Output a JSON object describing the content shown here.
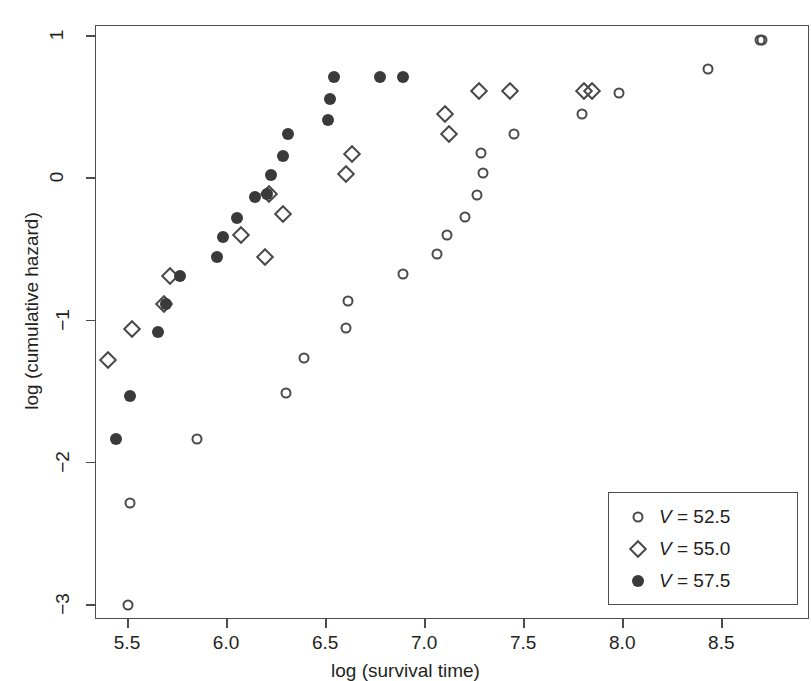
{
  "chart_data": {
    "type": "scatter",
    "title": "",
    "xlabel": "log (survival time)",
    "ylabel": "log (cumulative hazard)",
    "xlim": [
      5.34,
      8.94
    ],
    "ylim": [
      -3.17,
      1.07
    ],
    "xticks": [
      "5.5",
      "6.0",
      "6.5",
      "7.0",
      "7.5",
      "8.0",
      "8.5"
    ],
    "xtick_values": [
      5.5,
      6.0,
      6.5,
      7.0,
      7.5,
      8.0,
      8.5
    ],
    "yticks": [
      "1",
      "0",
      "−1",
      "−2",
      "−3"
    ],
    "ytick_values": [
      1,
      0,
      -1,
      -2,
      -3
    ],
    "grid": false,
    "legend_position": "bottom-right",
    "series": [
      {
        "name": "V = 52.5",
        "label_prefix": "V",
        "label_value": "52.5",
        "marker": "open-circle",
        "color": "#4a4a4a",
        "points": [
          [
            5.5,
            -3.0
          ],
          [
            5.51,
            -2.28
          ],
          [
            5.85,
            -1.83
          ],
          [
            6.3,
            -1.51
          ],
          [
            6.39,
            -1.26
          ],
          [
            6.6,
            -1.05
          ],
          [
            6.61,
            -0.86
          ],
          [
            6.89,
            -0.67
          ],
          [
            7.06,
            -0.53
          ],
          [
            7.11,
            -0.4
          ],
          [
            7.2,
            -0.27
          ],
          [
            7.26,
            -0.12
          ],
          [
            7.29,
            0.04
          ],
          [
            7.45,
            0.31
          ],
          [
            7.28,
            0.18
          ],
          [
            7.79,
            0.45
          ],
          [
            7.98,
            0.6
          ],
          [
            8.43,
            0.77
          ],
          [
            8.69,
            0.97
          ],
          [
            8.7,
            0.97
          ]
        ]
      },
      {
        "name": "V = 55.0",
        "label_prefix": "V",
        "label_value": "55.0",
        "marker": "open-diamond",
        "color": "#4a4a4a",
        "points": [
          [
            5.4,
            -1.28
          ],
          [
            5.52,
            -1.06
          ],
          [
            5.68,
            -0.88
          ],
          [
            5.71,
            -0.69
          ],
          [
            6.07,
            -0.4
          ],
          [
            6.19,
            -0.55
          ],
          [
            6.21,
            -0.11
          ],
          [
            6.28,
            -0.25
          ],
          [
            6.6,
            0.03
          ],
          [
            6.63,
            0.17
          ],
          [
            7.1,
            0.45
          ],
          [
            7.12,
            0.31
          ],
          [
            7.27,
            0.61
          ],
          [
            7.43,
            0.61
          ],
          [
            7.8,
            0.61
          ],
          [
            7.84,
            0.61
          ]
        ]
      },
      {
        "name": "V = 57.5",
        "label_prefix": "V",
        "label_value": "57.5",
        "marker": "filled-circle",
        "color": "#3a3a3a",
        "points": [
          [
            5.44,
            -1.83
          ],
          [
            5.51,
            -1.53
          ],
          [
            5.65,
            -1.08
          ],
          [
            5.69,
            -0.88
          ],
          [
            5.76,
            -0.69
          ],
          [
            5.95,
            -0.55
          ],
          [
            5.98,
            -0.41
          ],
          [
            6.05,
            -0.28
          ],
          [
            6.14,
            -0.13
          ],
          [
            6.2,
            -0.11
          ],
          [
            6.22,
            0.02
          ],
          [
            6.28,
            0.16
          ],
          [
            6.31,
            0.31
          ],
          [
            6.51,
            0.41
          ],
          [
            6.52,
            0.56
          ],
          [
            6.54,
            0.71
          ],
          [
            6.77,
            0.71
          ],
          [
            6.89,
            0.71
          ]
        ]
      }
    ]
  }
}
